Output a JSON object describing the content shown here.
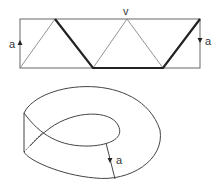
{
  "figure": {
    "top": {
      "vertex_label": "v",
      "left_edge_label": "a",
      "right_edge_label": "a"
    },
    "bottom": {
      "edge_label": "a"
    }
  }
}
